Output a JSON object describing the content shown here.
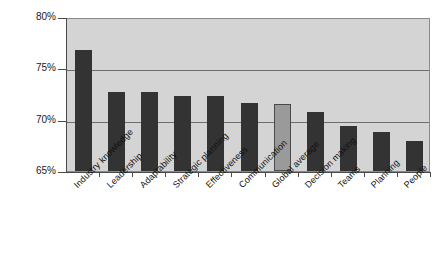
{
  "chart_data": {
    "type": "bar",
    "title": "",
    "xlabel": "",
    "ylabel": "",
    "ylim": [
      65,
      80
    ],
    "ytick_labels": [
      "80%",
      "75%",
      "70%",
      "65%"
    ],
    "yticks": [
      80,
      75,
      70,
      65
    ],
    "grid": true,
    "legend": "none",
    "categories": [
      "Industry knowledge",
      "Leadership",
      "Adaptability",
      "Strategic planning",
      "Effectiveness",
      "Communication",
      "Global average",
      "Decision making",
      "Teams",
      "Planning",
      "People"
    ],
    "values": [
      76.8,
      72.7,
      72.7,
      72.3,
      72.3,
      71.6,
      71.5,
      70.7,
      69.4,
      68.8,
      67.9
    ],
    "value_labels": [
      "76.8%",
      "72.7%",
      "72.7%",
      "72.3%",
      "72.3%",
      "71.6%",
      "71.5%",
      "70.7%",
      "69.4%",
      "68.8%",
      "67.9%"
    ],
    "highlight_index": 6,
    "colors": {
      "bar": "#333333",
      "highlight_bar": "#9a9a9a",
      "plot_background": "#d4d4d4",
      "gridline": "#6e6e6e",
      "axis": "#4a4a4a",
      "text": "#101010",
      "page_background": "#ffffff"
    }
  }
}
